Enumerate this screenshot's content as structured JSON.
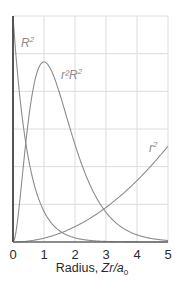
{
  "chart_data": {
    "type": "line",
    "title": "",
    "xlabel": "Radius, Zr/a0",
    "xlabel_parts": {
      "prefix": "Radius, ",
      "italic": "Zr/a",
      "subscript": "0"
    },
    "ylabel": "",
    "xlim": [
      0,
      5
    ],
    "ylim": [
      0,
      1
    ],
    "x_ticks": [
      "0",
      "1",
      "2",
      "3",
      "4",
      "5"
    ],
    "y_ticks": [],
    "grid": true,
    "legend": "inline labels",
    "series": [
      {
        "name": "R²",
        "label_base": "R",
        "label_sup": "2",
        "description": "decays from maximum at r=0",
        "x": [
          0,
          0.1,
          0.2,
          0.3,
          0.4,
          0.5,
          0.6,
          0.8,
          1.0,
          1.5,
          2.0,
          3.0,
          4.0,
          5.0
        ],
        "values": [
          1.0,
          0.819,
          0.67,
          0.549,
          0.449,
          0.368,
          0.301,
          0.202,
          0.135,
          0.05,
          0.018,
          0.002,
          0.0003,
          5e-05
        ]
      },
      {
        "name": "r²R²",
        "label_base": "r²R",
        "label_sup": "2",
        "description": "radial distribution, peak at r=1",
        "x": [
          0,
          0.25,
          0.5,
          0.75,
          1.0,
          1.25,
          1.5,
          2.0,
          2.5,
          3.0,
          3.5,
          4.0,
          4.5,
          5.0
        ],
        "values": [
          0,
          0.38,
          0.74,
          0.94,
          1.0,
          0.94,
          0.82,
          0.54,
          0.31,
          0.16,
          0.083,
          0.04,
          0.018,
          0.008
        ]
      },
      {
        "name": "r²",
        "label_base": "r",
        "label_sup": "2",
        "description": "parabolic increase",
        "x": [
          0,
          1,
          2,
          3,
          4,
          5
        ],
        "values": [
          0,
          1,
          4,
          9,
          16,
          25
        ]
      }
    ],
    "colors": {
      "axis": "#555555",
      "curve": "#8c8c8c",
      "grid": "#dcdcdc",
      "text": "#2a2a2a"
    }
  }
}
